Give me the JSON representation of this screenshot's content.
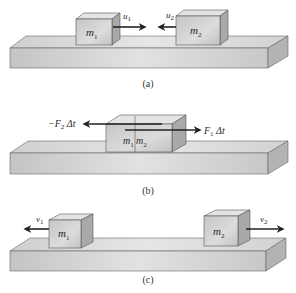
{
  "figure": {
    "panels": [
      {
        "id": "a",
        "caption": "(a)",
        "blocks": [
          {
            "label": "m",
            "sub": "1"
          },
          {
            "label": "m",
            "sub": "2"
          }
        ],
        "arrows": [
          {
            "label": "u",
            "sub": "1",
            "direction": "right"
          },
          {
            "label": "u",
            "sub": "2",
            "direction": "left"
          }
        ]
      },
      {
        "id": "b",
        "caption": "(b)",
        "blocks": [
          {
            "label": "m",
            "sub": "1"
          },
          {
            "label": "m",
            "sub": "2"
          }
        ],
        "arrows": [
          {
            "label_prefix": "−F",
            "sub": "2",
            "suffix": " Δt",
            "direction": "left"
          },
          {
            "label_prefix": "F",
            "sub": "1",
            "suffix": " Δt",
            "direction": "right"
          }
        ]
      },
      {
        "id": "c",
        "caption": "(c)",
        "blocks": [
          {
            "label": "m",
            "sub": "1"
          },
          {
            "label": "m",
            "sub": "2"
          }
        ],
        "arrows": [
          {
            "label": "v",
            "sub": "1",
            "direction": "left"
          },
          {
            "label": "v",
            "sub": "2",
            "direction": "right"
          }
        ]
      }
    ],
    "colors": {
      "platform_top": "#d9d9d9",
      "platform_front": "#c8c8c8",
      "platform_side": "#b3b3b3",
      "block_front": "#d0d0d0",
      "block_top": "#e4e4e4",
      "block_side": "#a9a9a9",
      "edge": "#555555",
      "arrow": "#222222"
    }
  }
}
